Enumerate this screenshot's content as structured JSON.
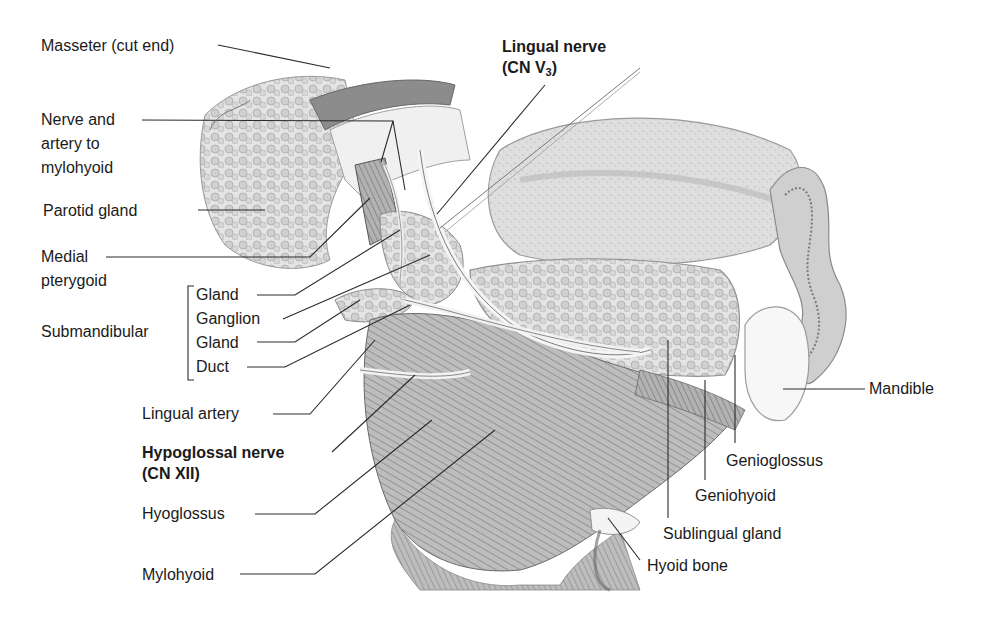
{
  "figure": {
    "type": "anatomical-illustration",
    "labels": {
      "masseter": "Masseter (cut end)",
      "nerve_artery_l1": "Nerve and",
      "nerve_artery_l2": "artery to",
      "nerve_artery_l3": "mylohyoid",
      "parotid": "Parotid gland",
      "medial_pterygoid_l1": "Medial",
      "medial_pterygoid_l2": "pterygoid",
      "submandibular": "Submandibular",
      "sub_gland_1": "Gland",
      "sub_ganglion": "Ganglion",
      "sub_gland_2": "Gland",
      "sub_duct": "Duct",
      "lingual_artery": "Lingual artery",
      "hypoglossal_l1": "Hypoglossal nerve",
      "hypoglossal_l2": "(CN XII)",
      "hyoglossus": "Hyoglossus",
      "mylohyoid": "Mylohyoid",
      "lingual_nerve_l1": "Lingual nerve",
      "lingual_nerve_l2_prefix": "(CN V",
      "lingual_nerve_l2_sub": "3",
      "lingual_nerve_l2_suffix": ")",
      "mandible": "Mandible",
      "genioglossus": "Genioglossus",
      "geniohyoid": "Geniohyoid",
      "sublingual": "Sublingual gland",
      "hyoid": "Hyoid bone"
    },
    "bold_labels": [
      "Lingual nerve (CN V3)",
      "Hypoglossal nerve (CN XII)"
    ],
    "colors": {
      "background": "#ffffff",
      "text": "#1a1a1a",
      "leader_line": "#2a2a2a",
      "tissue_light": "#e6e6e6",
      "tissue_mid": "#c4c4c4",
      "tissue_dark": "#8a8a8a"
    }
  }
}
